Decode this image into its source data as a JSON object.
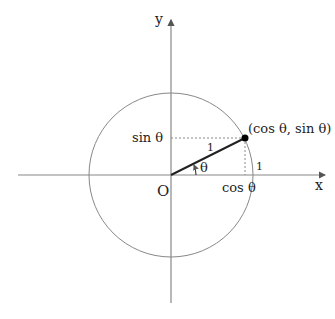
{
  "diagram": {
    "axes": {
      "x_label": "x",
      "y_label": "y",
      "origin_label": "O"
    },
    "labels": {
      "point": "(cos θ, sin θ)",
      "sin": "sin θ",
      "cos": "cos θ",
      "radius": "1",
      "x_intercept": "1",
      "angle": "θ"
    },
    "colors": {
      "axis": "#888888",
      "circle": "#888888",
      "radius_line": "#222222",
      "dotted": "#888888",
      "point": "#000000"
    }
  }
}
